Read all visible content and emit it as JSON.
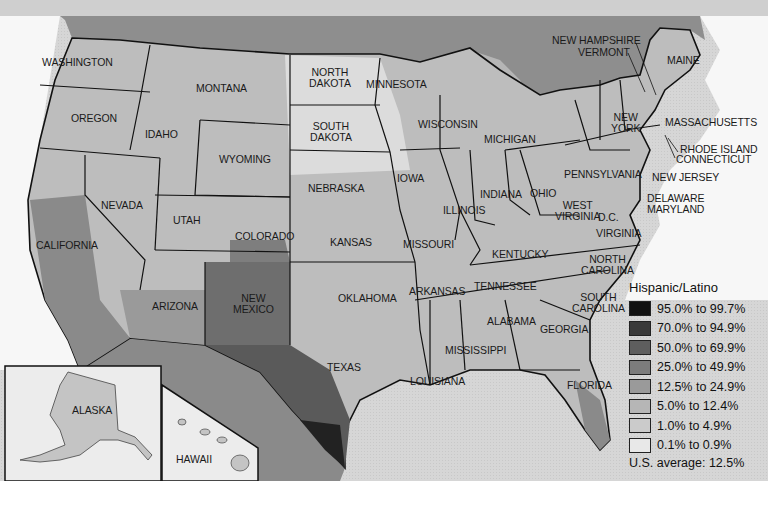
{
  "map": {
    "title": "Hispanic/Latino",
    "subject": "Hispanic/Latino population share by county, United States",
    "states": [
      {
        "id": "washington",
        "label": "WASHINGTON",
        "x": 42,
        "y": 57
      },
      {
        "id": "oregon",
        "label": "OREGON",
        "x": 71,
        "y": 113
      },
      {
        "id": "idaho",
        "label": "IDAHO",
        "x": 145,
        "y": 129
      },
      {
        "id": "montana",
        "label": "MONTANA",
        "x": 196,
        "y": 83
      },
      {
        "id": "wyoming",
        "label": "WYOMING",
        "x": 219,
        "y": 154
      },
      {
        "id": "north-dakota",
        "label": "NORTH\nDAKOTA",
        "x": 309,
        "y": 73
      },
      {
        "id": "south-dakota",
        "label": "SOUTH\nDAKOTA",
        "x": 310,
        "y": 127
      },
      {
        "id": "minnesota",
        "label": "MINNESOTA",
        "x": 366,
        "y": 79
      },
      {
        "id": "wisconsin",
        "label": "WISCONSIN",
        "x": 418,
        "y": 119
      },
      {
        "id": "michigan",
        "label": "MICHIGAN",
        "x": 484,
        "y": 134
      },
      {
        "id": "nevada",
        "label": "NEVADA",
        "x": 101,
        "y": 200
      },
      {
        "id": "utah",
        "label": "UTAH",
        "x": 173,
        "y": 215
      },
      {
        "id": "colorado",
        "label": "COLORADO",
        "x": 235,
        "y": 231
      },
      {
        "id": "nebraska",
        "label": "NEBRASKA",
        "x": 308,
        "y": 183
      },
      {
        "id": "iowa",
        "label": "IOWA",
        "x": 397,
        "y": 173
      },
      {
        "id": "illinois",
        "label": "ILLINOIS",
        "x": 443,
        "y": 205
      },
      {
        "id": "indiana",
        "label": "INDIANA",
        "x": 480,
        "y": 189
      },
      {
        "id": "ohio",
        "label": "OHIO",
        "x": 530,
        "y": 188
      },
      {
        "id": "pennsylvania",
        "label": "PENNSYLVANIA",
        "x": 564,
        "y": 169
      },
      {
        "id": "new-york",
        "label": "NEW\nYORK",
        "x": 611,
        "y": 116
      },
      {
        "id": "california",
        "label": "CALIFORNIA",
        "x": 36,
        "y": 240
      },
      {
        "id": "kansas",
        "label": "KANSAS",
        "x": 330,
        "y": 237
      },
      {
        "id": "missouri",
        "label": "MISSOURI",
        "x": 403,
        "y": 239
      },
      {
        "id": "kentucky",
        "label": "KENTUCKY",
        "x": 492,
        "y": 249
      },
      {
        "id": "west-virginia",
        "label": "WEST\nVIRGINIA",
        "x": 555,
        "y": 201
      },
      {
        "id": "virginia",
        "label": "VIRGINIA",
        "x": 596,
        "y": 228
      },
      {
        "id": "dc",
        "label": "D.C.",
        "x": 598,
        "y": 212
      },
      {
        "id": "arizona",
        "label": "ARIZONA",
        "x": 152,
        "y": 301
      },
      {
        "id": "new-mexico",
        "label": "NEW\nMEXICO",
        "x": 233,
        "y": 294
      },
      {
        "id": "oklahoma",
        "label": "OKLAHOMA",
        "x": 338,
        "y": 293
      },
      {
        "id": "arkansas",
        "label": "ARKANSAS",
        "x": 409,
        "y": 286
      },
      {
        "id": "tennessee",
        "label": "TENNESSEE",
        "x": 474,
        "y": 281
      },
      {
        "id": "north-carolina",
        "label": "NORTH\nCAROLINA",
        "x": 581,
        "y": 255
      },
      {
        "id": "south-carolina",
        "label": "SOUTH\nCAROLINA",
        "x": 572,
        "y": 293
      },
      {
        "id": "texas",
        "label": "TEXAS",
        "x": 327,
        "y": 362
      },
      {
        "id": "alabama",
        "label": "ALABAMA",
        "x": 487,
        "y": 316
      },
      {
        "id": "georgia",
        "label": "GEORGIA",
        "x": 540,
        "y": 324
      },
      {
        "id": "mississippi",
        "label": "MISSISSIPPI",
        "x": 445,
        "y": 345
      },
      {
        "id": "louisiana",
        "label": "LOUISIANA",
        "x": 410,
        "y": 376
      },
      {
        "id": "florida",
        "label": "FLORIDA",
        "x": 567,
        "y": 380
      },
      {
        "id": "alaska",
        "label": "ALASKA",
        "x": 72,
        "y": 405
      },
      {
        "id": "hawaii",
        "label": "HAWAII",
        "x": 176,
        "y": 454
      },
      {
        "id": "maine",
        "label": "MAINE",
        "x": 667,
        "y": 55
      },
      {
        "id": "new-hampshire",
        "label": "NEW HAMPSHIRE",
        "x": 552,
        "y": 35
      },
      {
        "id": "vermont",
        "label": "VERMONT",
        "x": 578,
        "y": 47
      },
      {
        "id": "massachusetts",
        "label": "MASSACHUSETTS",
        "x": 665,
        "y": 117
      },
      {
        "id": "rhode-island",
        "label": "RHODE ISLAND",
        "x": 680,
        "y": 144
      },
      {
        "id": "connecticut",
        "label": "CONNECTICUT",
        "x": 676,
        "y": 154
      },
      {
        "id": "new-jersey",
        "label": "NEW JERSEY",
        "x": 652,
        "y": 172
      },
      {
        "id": "delaware",
        "label": "DELAWARE",
        "x": 647,
        "y": 193
      },
      {
        "id": "maryland",
        "label": "MARYLAND",
        "x": 647,
        "y": 204
      }
    ]
  },
  "legend": {
    "title": "Hispanic/Latino",
    "items": [
      {
        "label": "95.0% to 99.7%",
        "color": "#111111"
      },
      {
        "label": "70.0% to 94.9%",
        "color": "#3a3a3a"
      },
      {
        "label": "50.0% to 69.9%",
        "color": "#5e5e5e"
      },
      {
        "label": "25.0% to 49.9%",
        "color": "#7c7c7c"
      },
      {
        "label": "12.5% to 24.9%",
        "color": "#9a9a9a"
      },
      {
        "label": "5.0% to 12.4%",
        "color": "#b6b6b6"
      },
      {
        "label": "1.0% to 4.9%",
        "color": "#cbcbcb"
      },
      {
        "label": "0.1% to 0.9%",
        "color": "#e8e8e8"
      }
    ],
    "average_label": "U.S. average:",
    "average_value": "12.5%"
  },
  "colors": {
    "canada_water": "#8a8a8a",
    "ocean": "#d9d9d9",
    "border": "#111111",
    "top_strip": "#c8c8c8"
  }
}
